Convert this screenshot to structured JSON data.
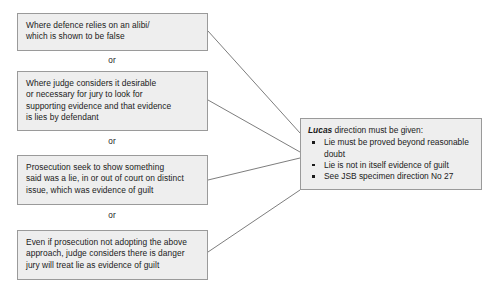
{
  "diagram": {
    "background_color": "#ffffff",
    "box_fill_color": "#eeeeee",
    "box_border_color": "#9a9a9a",
    "connector_color": "#6e6e6e",
    "conditions": [
      {
        "id": "alibi",
        "lines": [
          "Where defence relies on an alibi/",
          "which is shown to be false"
        ]
      },
      {
        "id": "judge-considers-desirable",
        "lines": [
          "Where judge considers it desirable",
          "or necessary for jury to look for",
          "supporting evidence and that evidence",
          "is lies by defendant"
        ]
      },
      {
        "id": "prosecution-show-lie",
        "lines": [
          "Prosecution seek to show something",
          "said was a lie, in or out of court on distinct",
          "issue, which was evidence of guilt"
        ]
      },
      {
        "id": "danger-jury-treat-lie",
        "lines": [
          "Even if prosecution not adopting the above",
          "approach, judge considers there is danger",
          "jury will treat lie as evidence of guilt"
        ]
      }
    ],
    "separators": [
      {
        "label": "or"
      },
      {
        "label": "or"
      },
      {
        "label": "or"
      }
    ],
    "outcome": {
      "heading_emphasis": "Lucas",
      "heading_rest": " direction must be given:",
      "bullets": [
        "Lie must be proved beyond reasonable doubt",
        "Lie is not in itself evidence of guilt",
        "See JSB specimen direction No 27"
      ]
    }
  }
}
